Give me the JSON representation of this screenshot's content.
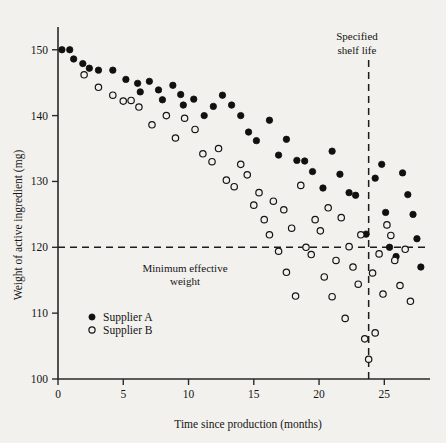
{
  "chart_data": {
    "type": "scatter",
    "title": "",
    "xlabel": "Time since production (months)",
    "ylabel": "Weight of active ingredient (mg)",
    "xlim": [
      0,
      28.5
    ],
    "ylim": [
      100,
      153
    ],
    "xticks": [
      0,
      5,
      10,
      15,
      20,
      25
    ],
    "yticks": [
      100,
      110,
      120,
      130,
      140,
      150
    ],
    "grid": false,
    "legend_position": "lower-left-inside",
    "series": [
      {
        "name": "Supplier A",
        "marker": "filled-circle",
        "color": "#101010",
        "points": [
          [
            0.3,
            150.0
          ],
          [
            0.9,
            150.0
          ],
          [
            1.2,
            148.6
          ],
          [
            1.9,
            147.9
          ],
          [
            2.4,
            147.2
          ],
          [
            3.1,
            146.9
          ],
          [
            4.2,
            146.9
          ],
          [
            5.2,
            145.5
          ],
          [
            6.1,
            144.9
          ],
          [
            6.3,
            143.6
          ],
          [
            7.0,
            145.2
          ],
          [
            7.7,
            143.9
          ],
          [
            8.0,
            142.4
          ],
          [
            8.8,
            144.6
          ],
          [
            9.4,
            143.2
          ],
          [
            9.6,
            141.6
          ],
          [
            10.4,
            142.5
          ],
          [
            11.2,
            140.0
          ],
          [
            11.9,
            141.4
          ],
          [
            12.6,
            143.1
          ],
          [
            13.3,
            141.6
          ],
          [
            14.0,
            140.0
          ],
          [
            14.6,
            137.5
          ],
          [
            15.2,
            136.2
          ],
          [
            16.2,
            139.3
          ],
          [
            16.9,
            134.0
          ],
          [
            17.5,
            136.4
          ],
          [
            18.3,
            133.2
          ],
          [
            18.9,
            133.1
          ],
          [
            19.5,
            131.5
          ],
          [
            20.3,
            129.0
          ],
          [
            21.0,
            134.6
          ],
          [
            21.6,
            131.1
          ],
          [
            22.3,
            128.3
          ],
          [
            22.8,
            127.9
          ],
          [
            23.6,
            122.0
          ],
          [
            24.3,
            130.5
          ],
          [
            24.8,
            132.6
          ],
          [
            25.1,
            125.3
          ],
          [
            25.4,
            120.0
          ],
          [
            25.9,
            118.6
          ],
          [
            26.4,
            131.3
          ],
          [
            26.8,
            128.0
          ],
          [
            27.2,
            125.0
          ],
          [
            27.5,
            121.3
          ],
          [
            27.8,
            117.0
          ]
        ]
      },
      {
        "name": "Supplier B",
        "marker": "open-circle",
        "color": "#141414",
        "points": [
          [
            2.0,
            146.2
          ],
          [
            3.1,
            144.3
          ],
          [
            4.2,
            143.1
          ],
          [
            5.0,
            142.2
          ],
          [
            5.6,
            142.3
          ],
          [
            6.2,
            141.3
          ],
          [
            7.2,
            138.6
          ],
          [
            8.3,
            140.0
          ],
          [
            9.0,
            136.6
          ],
          [
            9.7,
            139.6
          ],
          [
            10.5,
            137.9
          ],
          [
            11.1,
            134.2
          ],
          [
            11.8,
            133.0
          ],
          [
            12.3,
            135.0
          ],
          [
            12.9,
            130.2
          ],
          [
            13.5,
            129.2
          ],
          [
            14.0,
            132.6
          ],
          [
            14.5,
            131.0
          ],
          [
            15.0,
            126.4
          ],
          [
            15.4,
            128.3
          ],
          [
            15.8,
            124.2
          ],
          [
            16.2,
            121.9
          ],
          [
            16.5,
            127.0
          ],
          [
            16.9,
            119.4
          ],
          [
            17.3,
            125.7
          ],
          [
            17.5,
            116.2
          ],
          [
            17.9,
            122.9
          ],
          [
            18.2,
            112.6
          ],
          [
            18.6,
            129.4
          ],
          [
            19.0,
            120.0
          ],
          [
            19.4,
            118.9
          ],
          [
            19.7,
            124.2
          ],
          [
            20.1,
            122.5
          ],
          [
            20.4,
            115.5
          ],
          [
            20.7,
            126.0
          ],
          [
            21.0,
            112.5
          ],
          [
            21.3,
            118.0
          ],
          [
            21.7,
            124.5
          ],
          [
            22.0,
            109.2
          ],
          [
            22.3,
            120.1
          ],
          [
            22.6,
            117.0
          ],
          [
            23.0,
            114.4
          ],
          [
            23.2,
            121.9
          ],
          [
            23.5,
            106.1
          ],
          [
            23.8,
            103.0
          ],
          [
            24.1,
            116.1
          ],
          [
            24.3,
            107.0
          ],
          [
            24.6,
            119.0
          ],
          [
            24.9,
            112.9
          ],
          [
            25.2,
            123.4
          ],
          [
            25.5,
            121.8
          ],
          [
            25.8,
            118.0
          ],
          [
            26.2,
            114.2
          ],
          [
            26.6,
            119.7
          ],
          [
            27.0,
            111.8
          ]
        ]
      }
    ],
    "reference_lines": [
      {
        "orientation": "horizontal",
        "value": 120,
        "label": "Minimum effective weight",
        "style": "dashed"
      },
      {
        "orientation": "vertical",
        "value": 23.8,
        "label": "Specified shelf life",
        "style": "dashed"
      }
    ]
  },
  "labels": {
    "y_axis_title": "Weight of active ingredient (mg)",
    "x_axis_title": "Time since production (months)",
    "min_effective_line1": "Minimum effective",
    "min_effective_line2": "weight",
    "shelf_life_line1": "Specified",
    "shelf_life_line2": "shelf life",
    "legend_a": "Supplier A",
    "legend_b": "Supplier B"
  },
  "ticklabels": {
    "y": [
      "150",
      "140",
      "130",
      "120",
      "110",
      "100"
    ],
    "x": [
      "0",
      "5",
      "10",
      "15",
      "20",
      "25"
    ]
  }
}
